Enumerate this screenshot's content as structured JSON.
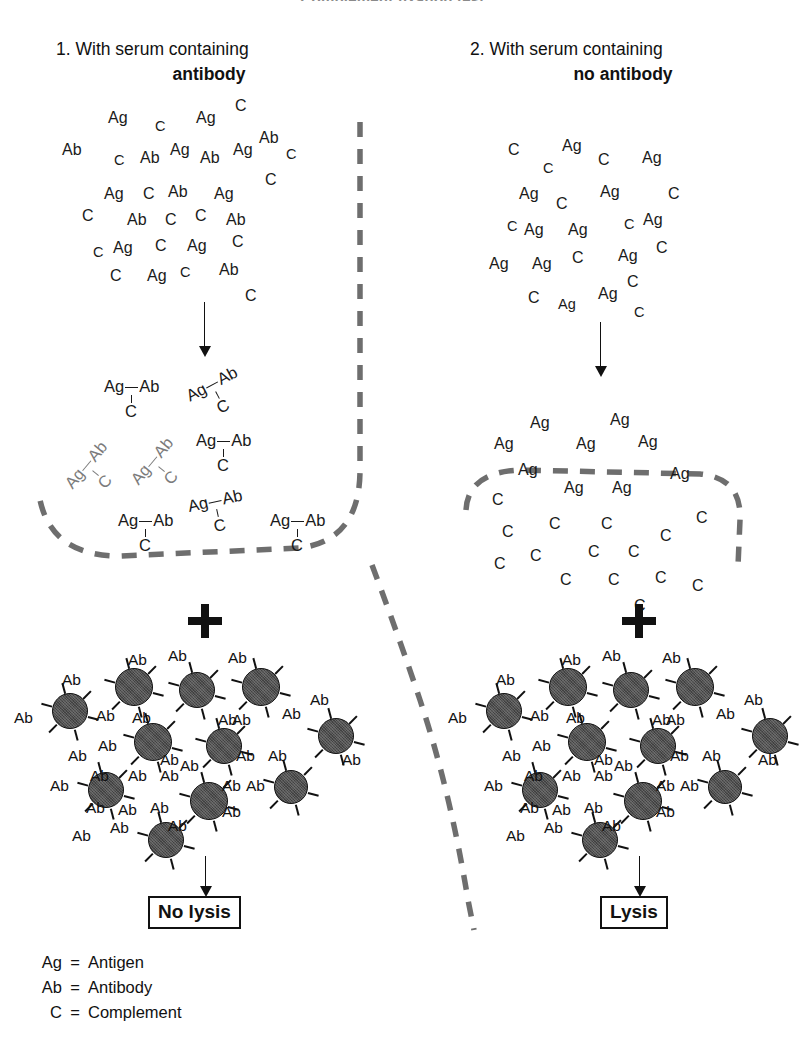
{
  "figure": {
    "title": "Complement fixation test",
    "legend": [
      {
        "symbol": "Ag",
        "eq": "=",
        "meaning": "Antigen"
      },
      {
        "symbol": "Ab",
        "eq": "=",
        "meaning": "Antibody"
      },
      {
        "symbol": "C",
        "eq": "=",
        "meaning": "Complement"
      }
    ]
  },
  "columns": [
    {
      "number": "1.",
      "heading": "With serum containing",
      "subject": "antibody",
      "result": "No lysis",
      "plus": "+",
      "mixture_tokens": [
        {
          "t": "Ag",
          "x": 108,
          "y": 110,
          "r": 0
        },
        {
          "t": "C",
          "x": 155,
          "y": 118,
          "r": 0,
          "sm": true
        },
        {
          "t": "Ag",
          "x": 196,
          "y": 110,
          "r": 0
        },
        {
          "t": "C",
          "x": 235,
          "y": 98,
          "r": 0
        },
        {
          "t": "Ab",
          "x": 62,
          "y": 142,
          "r": 0
        },
        {
          "t": "C",
          "x": 114,
          "y": 152,
          "r": 0,
          "sm": true
        },
        {
          "t": "Ab",
          "x": 140,
          "y": 150,
          "r": 0
        },
        {
          "t": "Ag",
          "x": 170,
          "y": 142,
          "r": 0
        },
        {
          "t": "Ab",
          "x": 200,
          "y": 150,
          "r": 0
        },
        {
          "t": "Ag",
          "x": 233,
          "y": 142,
          "r": 0
        },
        {
          "t": "Ab",
          "x": 259,
          "y": 130,
          "r": 0
        },
        {
          "t": "C",
          "x": 286,
          "y": 146,
          "r": 0,
          "sm": true
        },
        {
          "t": "Ag",
          "x": 104,
          "y": 186,
          "r": 0
        },
        {
          "t": "C",
          "x": 143,
          "y": 186,
          "r": 0
        },
        {
          "t": "Ab",
          "x": 168,
          "y": 184,
          "r": 0
        },
        {
          "t": "Ag",
          "x": 214,
          "y": 186,
          "r": 0
        },
        {
          "t": "C",
          "x": 265,
          "y": 172,
          "r": 0
        },
        {
          "t": "C",
          "x": 82,
          "y": 208,
          "r": 0
        },
        {
          "t": "Ab",
          "x": 127,
          "y": 212,
          "r": 0
        },
        {
          "t": "C",
          "x": 165,
          "y": 212,
          "r": 0
        },
        {
          "t": "C",
          "x": 195,
          "y": 208,
          "r": 0
        },
        {
          "t": "Ab",
          "x": 226,
          "y": 212,
          "r": 0
        },
        {
          "t": "Ag",
          "x": 187,
          "y": 238,
          "r": 0
        },
        {
          "t": "C",
          "x": 232,
          "y": 234,
          "r": 0
        },
        {
          "t": "C",
          "x": 93,
          "y": 244,
          "r": 0,
          "sm": true
        },
        {
          "t": "Ag",
          "x": 113,
          "y": 240,
          "r": 0
        },
        {
          "t": "C",
          "x": 155,
          "y": 238,
          "r": 0
        },
        {
          "t": "C",
          "x": 180,
          "y": 264,
          "r": 0,
          "sm": true
        },
        {
          "t": "Ab",
          "x": 219,
          "y": 262,
          "r": 0
        },
        {
          "t": "C",
          "x": 110,
          "y": 268,
          "r": 0
        },
        {
          "t": "Ag",
          "x": 147,
          "y": 268,
          "r": 0
        },
        {
          "t": "C",
          "x": 245,
          "y": 288,
          "r": 0
        }
      ],
      "complexes": [
        {
          "x": 104,
          "y": 378,
          "rot": 0,
          "faint": false
        },
        {
          "x": 190,
          "y": 374,
          "rot": -28,
          "faint": false
        },
        {
          "x": 68,
          "y": 452,
          "rot": -50,
          "faint": true
        },
        {
          "x": 134,
          "y": 448,
          "rot": -50,
          "faint": true
        },
        {
          "x": 196,
          "y": 432,
          "rot": 0,
          "faint": false
        },
        {
          "x": 118,
          "y": 512,
          "rot": 0,
          "faint": false
        },
        {
          "x": 190,
          "y": 492,
          "rot": -12,
          "faint": false
        },
        {
          "x": 270,
          "y": 512,
          "rot": 0,
          "faint": false
        }
      ]
    },
    {
      "number": "2.",
      "heading": "With serum containing",
      "subject": "no antibody",
      "result": "Lysis",
      "plus": "+",
      "mixture_tokens": [
        {
          "t": "C",
          "x": 508,
          "y": 142,
          "r": 0
        },
        {
          "t": "C",
          "x": 543,
          "y": 160,
          "r": 0,
          "sm": true
        },
        {
          "t": "Ag",
          "x": 562,
          "y": 138,
          "r": 0
        },
        {
          "t": "C",
          "x": 598,
          "y": 152,
          "r": 0
        },
        {
          "t": "Ag",
          "x": 642,
          "y": 150,
          "r": 0
        },
        {
          "t": "Ag",
          "x": 519,
          "y": 186,
          "r": 0
        },
        {
          "t": "C",
          "x": 556,
          "y": 196,
          "r": 0
        },
        {
          "t": "Ag",
          "x": 600,
          "y": 184,
          "r": 0
        },
        {
          "t": "C",
          "x": 668,
          "y": 186,
          "r": 0
        },
        {
          "t": "C",
          "x": 507,
          "y": 218,
          "r": 0,
          "sm": true
        },
        {
          "t": "Ag",
          "x": 524,
          "y": 222,
          "r": 0
        },
        {
          "t": "Ag",
          "x": 568,
          "y": 222,
          "r": 0
        },
        {
          "t": "C",
          "x": 624,
          "y": 216,
          "r": 0,
          "sm": true
        },
        {
          "t": "Ag",
          "x": 643,
          "y": 212,
          "r": 0
        },
        {
          "t": "Ag",
          "x": 489,
          "y": 256,
          "r": 0
        },
        {
          "t": "Ag",
          "x": 532,
          "y": 256,
          "r": 0
        },
        {
          "t": "C",
          "x": 572,
          "y": 250,
          "r": 0
        },
        {
          "t": "Ag",
          "x": 618,
          "y": 248,
          "r": 0
        },
        {
          "t": "C",
          "x": 656,
          "y": 240,
          "r": 0
        },
        {
          "t": "C",
          "x": 528,
          "y": 290,
          "r": 0
        },
        {
          "t": "Ag",
          "x": 558,
          "y": 296,
          "r": 0,
          "sm": true
        },
        {
          "t": "Ag",
          "x": 598,
          "y": 286,
          "r": 0
        },
        {
          "t": "C",
          "x": 627,
          "y": 274,
          "r": 0
        },
        {
          "t": "C",
          "x": 634,
          "y": 304,
          "r": 0,
          "sm": true
        }
      ],
      "free_ag_tokens": [
        {
          "t": "Ag",
          "x": 530,
          "y": 415,
          "r": 0
        },
        {
          "t": "Ag",
          "x": 494,
          "y": 436,
          "r": 0
        },
        {
          "t": "Ag",
          "x": 576,
          "y": 436,
          "r": 0
        },
        {
          "t": "Ag",
          "x": 610,
          "y": 412,
          "r": 0
        },
        {
          "t": "Ag",
          "x": 638,
          "y": 434,
          "r": 0
        },
        {
          "t": "Ag",
          "x": 518,
          "y": 462,
          "r": 0
        },
        {
          "t": "Ag",
          "x": 564,
          "y": 480,
          "r": 0
        },
        {
          "t": "Ag",
          "x": 612,
          "y": 480,
          "r": 0
        },
        {
          "t": "Ag",
          "x": 670,
          "y": 466,
          "r": 0
        }
      ],
      "free_c_tokens": [
        {
          "t": "C",
          "x": 492,
          "y": 492,
          "r": 0
        },
        {
          "t": "C",
          "x": 502,
          "y": 524,
          "r": 0
        },
        {
          "t": "C",
          "x": 549,
          "y": 516,
          "r": 0
        },
        {
          "t": "C",
          "x": 601,
          "y": 516,
          "r": 0
        },
        {
          "t": "C",
          "x": 660,
          "y": 528,
          "r": 0
        },
        {
          "t": "C",
          "x": 696,
          "y": 510,
          "r": 0
        },
        {
          "t": "C",
          "x": 494,
          "y": 556,
          "r": 0
        },
        {
          "t": "C",
          "x": 530,
          "y": 548,
          "r": 0
        },
        {
          "t": "C",
          "x": 588,
          "y": 544,
          "r": 0
        },
        {
          "t": "C",
          "x": 628,
          "y": 544,
          "r": 0
        },
        {
          "t": "C",
          "x": 560,
          "y": 572,
          "r": 0
        },
        {
          "t": "C",
          "x": 608,
          "y": 572,
          "r": 0
        },
        {
          "t": "C",
          "x": 655,
          "y": 570,
          "r": 0
        },
        {
          "t": "C",
          "x": 692,
          "y": 578,
          "r": 0
        },
        {
          "t": "C",
          "x": 634,
          "y": 598,
          "r": 0
        }
      ]
    }
  ],
  "cell_cluster": {
    "label": "Ab",
    "cells": [
      {
        "x": 52,
        "y": 693,
        "d": 36
      },
      {
        "x": 115,
        "y": 668,
        "d": 38
      },
      {
        "x": 179,
        "y": 672,
        "d": 36
      },
      {
        "x": 242,
        "y": 668,
        "d": 38
      },
      {
        "x": 318,
        "y": 718,
        "d": 36
      },
      {
        "x": 134,
        "y": 723,
        "d": 38
      },
      {
        "x": 206,
        "y": 728,
        "d": 36
      },
      {
        "x": 88,
        "y": 772,
        "d": 36
      },
      {
        "x": 190,
        "y": 782,
        "d": 38
      },
      {
        "x": 274,
        "y": 770,
        "d": 34
      },
      {
        "x": 148,
        "y": 822,
        "d": 36
      }
    ],
    "ab_labels": [
      {
        "x": 62,
        "y": 672
      },
      {
        "x": 14,
        "y": 710
      },
      {
        "x": 96,
        "y": 708
      },
      {
        "x": 128,
        "y": 652
      },
      {
        "x": 168,
        "y": 648
      },
      {
        "x": 218,
        "y": 712
      },
      {
        "x": 228,
        "y": 650
      },
      {
        "x": 282,
        "y": 706
      },
      {
        "x": 310,
        "y": 692
      },
      {
        "x": 98,
        "y": 738
      },
      {
        "x": 132,
        "y": 710
      },
      {
        "x": 68,
        "y": 748
      },
      {
        "x": 90,
        "y": 768
      },
      {
        "x": 160,
        "y": 752
      },
      {
        "x": 232,
        "y": 712
      },
      {
        "x": 236,
        "y": 748
      },
      {
        "x": 268,
        "y": 748
      },
      {
        "x": 342,
        "y": 752
      },
      {
        "x": 50,
        "y": 778
      },
      {
        "x": 128,
        "y": 768
      },
      {
        "x": 160,
        "y": 768
      },
      {
        "x": 180,
        "y": 758
      },
      {
        "x": 222,
        "y": 778
      },
      {
        "x": 246,
        "y": 778
      },
      {
        "x": 86,
        "y": 800
      },
      {
        "x": 118,
        "y": 802
      },
      {
        "x": 150,
        "y": 800
      },
      {
        "x": 72,
        "y": 828
      },
      {
        "x": 110,
        "y": 820
      },
      {
        "x": 168,
        "y": 818
      },
      {
        "x": 222,
        "y": 804
      }
    ]
  },
  "cell_cluster_right": {
    "cells": [
      {
        "x": 486,
        "y": 693,
        "d": 36
      },
      {
        "x": 549,
        "y": 668,
        "d": 38
      },
      {
        "x": 613,
        "y": 672,
        "d": 36
      },
      {
        "x": 676,
        "y": 668,
        "d": 38
      },
      {
        "x": 752,
        "y": 718,
        "d": 36
      },
      {
        "x": 568,
        "y": 723,
        "d": 38
      },
      {
        "x": 640,
        "y": 728,
        "d": 36
      },
      {
        "x": 522,
        "y": 772,
        "d": 36
      },
      {
        "x": 624,
        "y": 782,
        "d": 38
      },
      {
        "x": 708,
        "y": 770,
        "d": 34
      },
      {
        "x": 582,
        "y": 822,
        "d": 36
      }
    ],
    "ab_labels": [
      {
        "x": 496,
        "y": 672
      },
      {
        "x": 448,
        "y": 710
      },
      {
        "x": 530,
        "y": 708
      },
      {
        "x": 562,
        "y": 652
      },
      {
        "x": 602,
        "y": 648
      },
      {
        "x": 652,
        "y": 712
      },
      {
        "x": 662,
        "y": 650
      },
      {
        "x": 716,
        "y": 706
      },
      {
        "x": 744,
        "y": 692
      },
      {
        "x": 532,
        "y": 738
      },
      {
        "x": 566,
        "y": 710
      },
      {
        "x": 502,
        "y": 748
      },
      {
        "x": 524,
        "y": 768
      },
      {
        "x": 594,
        "y": 752
      },
      {
        "x": 666,
        "y": 712
      },
      {
        "x": 670,
        "y": 748
      },
      {
        "x": 702,
        "y": 748
      },
      {
        "x": 758,
        "y": 752
      },
      {
        "x": 484,
        "y": 778
      },
      {
        "x": 562,
        "y": 768
      },
      {
        "x": 594,
        "y": 768
      },
      {
        "x": 614,
        "y": 758
      },
      {
        "x": 656,
        "y": 778
      },
      {
        "x": 680,
        "y": 778
      },
      {
        "x": 520,
        "y": 800
      },
      {
        "x": 552,
        "y": 802
      },
      {
        "x": 584,
        "y": 800
      },
      {
        "x": 506,
        "y": 828
      },
      {
        "x": 544,
        "y": 820
      },
      {
        "x": 602,
        "y": 818
      },
      {
        "x": 656,
        "y": 804
      }
    ]
  }
}
